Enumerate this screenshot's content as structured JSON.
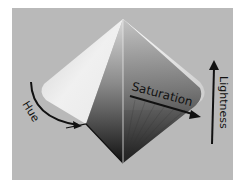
{
  "diagram": {
    "background_color": "#b9b9b9",
    "labels": {
      "hue": "Hue",
      "saturation": "Saturation",
      "lightness": "Lightness"
    },
    "colors": {
      "arrow": "#111111",
      "text": "#111111"
    }
  }
}
